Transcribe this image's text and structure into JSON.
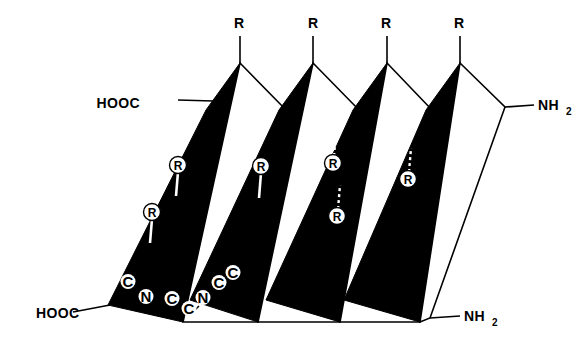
{
  "figure": {
    "background_color": "#ffffff",
    "ink_color": "#000000",
    "width": 588,
    "height": 352
  },
  "terminals": {
    "carboxyl_top": {
      "label": "HOOC",
      "x": 140,
      "y": 103
    },
    "carboxyl_bottom": {
      "label": "HOOC",
      "x": 36,
      "y": 315
    },
    "amino_top": {
      "text": "NH",
      "sub": "2",
      "x": 540,
      "y": 110
    },
    "amino_bottom": {
      "text": "NH",
      "sub": "2",
      "x": 466,
      "y": 320
    }
  },
  "r_groups_top": [
    {
      "label": "R",
      "x": 239,
      "y": 28
    },
    {
      "label": "R",
      "x": 313,
      "y": 28
    },
    {
      "label": "R",
      "x": 386,
      "y": 28
    },
    {
      "label": "R",
      "x": 459,
      "y": 28
    }
  ],
  "r_group_circles": [
    {
      "label": "R",
      "x": 178,
      "y": 165,
      "stem": "solid",
      "stem_direction": "down"
    },
    {
      "label": "R",
      "x": 152,
      "y": 212,
      "stem": "solid",
      "stem_direction": "down"
    },
    {
      "label": "R",
      "x": 261,
      "y": 166,
      "stem": "solid",
      "stem_direction": "down"
    },
    {
      "label": "R",
      "x": 333,
      "y": 163,
      "stem": "dashed",
      "stem_direction": "up"
    },
    {
      "label": "R",
      "x": 337,
      "y": 216,
      "stem": "dashed",
      "stem_direction": "up"
    },
    {
      "label": "R",
      "x": 408,
      "y": 179,
      "stem": "dashed",
      "stem_direction": "up"
    }
  ],
  "backbone_atoms": [
    {
      "label": "C",
      "x": 128,
      "y": 286
    },
    {
      "label": "N",
      "x": 146,
      "y": 301
    },
    {
      "label": "C",
      "x": 172,
      "y": 303
    },
    {
      "label": "C",
      "x": 189,
      "y": 313
    },
    {
      "label": "N",
      "x": 203,
      "y": 302
    },
    {
      "label": "C",
      "x": 219,
      "y": 287
    },
    {
      "label": "C",
      "x": 233,
      "y": 277
    }
  ],
  "geometry": {
    "top_apex_y": 63,
    "bottom_valley_y": 322,
    "apex_x": [
      240,
      313,
      387,
      460
    ],
    "valley_x": [
      183,
      258,
      340,
      420
    ],
    "description": "Zig-zag pleated ribbon, alternating black (shaded) and white facets, skewed so each band runs from upper-right to lower-left."
  }
}
